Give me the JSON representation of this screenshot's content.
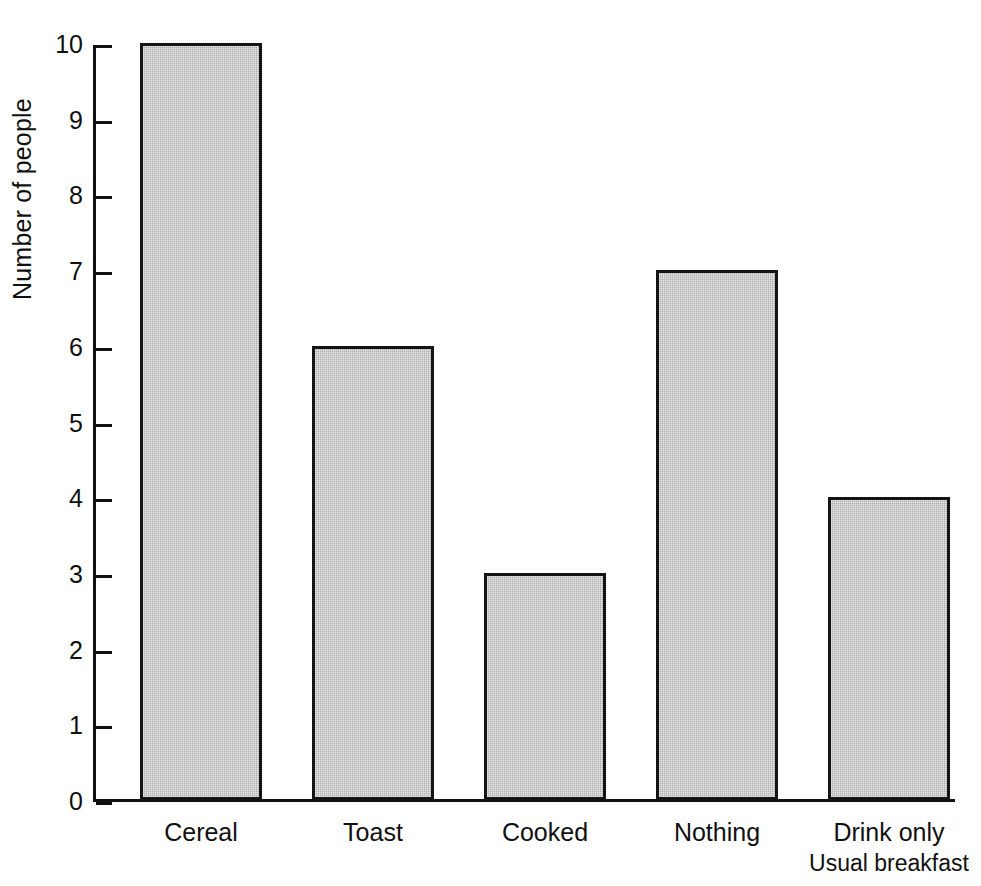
{
  "chart_data": {
    "type": "bar",
    "title": "",
    "xlabel": "Usual breakfast",
    "ylabel": "Number of people",
    "categories": [
      "Cereal",
      "Toast",
      "Cooked",
      "Nothing",
      "Drink only"
    ],
    "values": [
      10,
      6,
      3,
      7,
      4
    ],
    "ylim": [
      0,
      10
    ],
    "ytick_labels": [
      "0",
      "1",
      "2",
      "3",
      "4",
      "5",
      "6",
      "7",
      "8",
      "9",
      "10"
    ],
    "ytick_values": [
      0,
      1,
      2,
      3,
      4,
      5,
      6,
      7,
      8,
      9,
      10
    ],
    "grid": false,
    "legend": false,
    "colors": {
      "bar_fill": "#b9b9b9",
      "bar_border": "#141414",
      "axis": "#111111",
      "text": "#101010",
      "background": "#ffffff"
    }
  }
}
